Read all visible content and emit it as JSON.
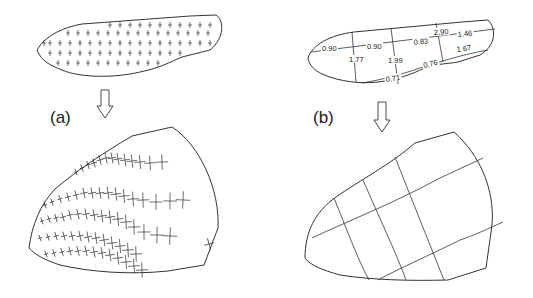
{
  "figure": {
    "panels": [
      {
        "id": "a",
        "label": "(a)",
        "label_pos": [
          50,
          92
        ]
      },
      {
        "id": "b",
        "label": "(b)",
        "label_pos": [
          313,
          92
        ]
      }
    ],
    "grid_values": [
      {
        "text": "0.90",
        "x": 322,
        "y": 51,
        "rot": 0
      },
      {
        "text": "1.77",
        "x": 349,
        "y": 62,
        "rot": 0
      },
      {
        "text": "0.90",
        "x": 367,
        "y": 49,
        "rot": 0
      },
      {
        "text": "1.99",
        "x": 388,
        "y": 63,
        "rot": 0
      },
      {
        "text": "0.83",
        "x": 414,
        "y": 45,
        "rot": -6
      },
      {
        "text": "2.90",
        "x": 434,
        "y": 35,
        "rot": -4
      },
      {
        "text": "1.46",
        "x": 458,
        "y": 37,
        "rot": -6
      },
      {
        "text": "1.67",
        "x": 457,
        "y": 52,
        "rot": -8
      },
      {
        "text": "0.76",
        "x": 424,
        "y": 68,
        "rot": -14
      },
      {
        "text": "0.71",
        "x": 386,
        "y": 82,
        "rot": -8
      }
    ],
    "colors": {
      "ink": "#333333",
      "background": "#ffffff"
    }
  }
}
